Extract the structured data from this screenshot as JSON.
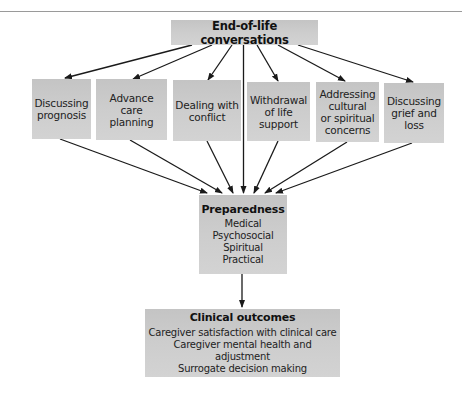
{
  "diagram": {
    "type": "flowchart",
    "top": {
      "title": "End-of-life conversations"
    },
    "conversation_topics": [
      {
        "lines": [
          "Discussing",
          "prognosis"
        ]
      },
      {
        "lines": [
          "Advance care",
          "planning"
        ]
      },
      {
        "lines": [
          "Dealing with",
          "conflict"
        ]
      },
      {
        "lines": [
          "Withdrawal",
          "of life",
          "support"
        ]
      },
      {
        "lines": [
          "Addressing",
          "cultural",
          "or spiritual",
          "concerns"
        ]
      },
      {
        "lines": [
          "Discussing",
          "grief and",
          "loss"
        ]
      }
    ],
    "preparedness": {
      "title": "Preparedness",
      "items": [
        "Medical",
        "Psychosocial",
        "Spiritual",
        "Practical"
      ]
    },
    "outcomes": {
      "title": "Clinical outcomes",
      "items": [
        "Caregiver satisfaction with clinical care",
        "Caregiver mental health and adjustment",
        "Surrogate decision making"
      ]
    },
    "colors": {
      "box_fill": "#cdcdcd",
      "arrow": "#1a1a1a",
      "text": "#1a1a1a"
    },
    "edges": [
      [
        "End-of-life conversations",
        "Discussing prognosis"
      ],
      [
        "End-of-life conversations",
        "Advance care planning"
      ],
      [
        "End-of-life conversations",
        "Dealing with conflict"
      ],
      [
        "End-of-life conversations",
        "Preparedness"
      ],
      [
        "End-of-life conversations",
        "Withdrawal of life support"
      ],
      [
        "End-of-life conversations",
        "Addressing cultural or spiritual concerns"
      ],
      [
        "End-of-life conversations",
        "Discussing grief and loss"
      ],
      [
        "Discussing prognosis",
        "Preparedness"
      ],
      [
        "Advance care planning",
        "Preparedness"
      ],
      [
        "Dealing with conflict",
        "Preparedness"
      ],
      [
        "Withdrawal of life support",
        "Preparedness"
      ],
      [
        "Addressing cultural or spiritual concerns",
        "Preparedness"
      ],
      [
        "Discussing grief and loss",
        "Preparedness"
      ],
      [
        "Preparedness",
        "Clinical outcomes"
      ]
    ]
  }
}
